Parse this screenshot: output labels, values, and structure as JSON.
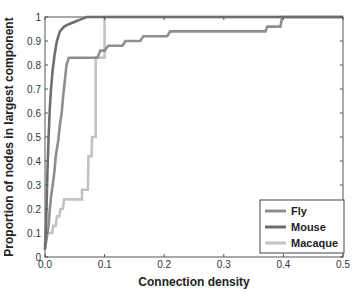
{
  "chart_data": {
    "type": "line",
    "title": "",
    "xlabel": "Connection density",
    "ylabel": "Proportion of nodes in largest component",
    "xlim": [
      0,
      0.5
    ],
    "ylim": [
      0,
      1
    ],
    "grid": false,
    "legend_position": "lower right",
    "x_ticks": [
      "0.0",
      "0.1",
      "0.2",
      "0.3",
      "0.4",
      "0.5"
    ],
    "y_ticks": [
      "0",
      "0.1",
      "0.2",
      "0.3",
      "0.4",
      "0.5",
      "0.6",
      "0.7",
      "0.8",
      "0.9",
      "1"
    ],
    "series": [
      {
        "name": "Fly",
        "color": "#8e8e8e",
        "points": [
          [
            0.0,
            0.04
          ],
          [
            0.003,
            0.08
          ],
          [
            0.006,
            0.13
          ],
          [
            0.008,
            0.2
          ],
          [
            0.01,
            0.25
          ],
          [
            0.013,
            0.3
          ],
          [
            0.016,
            0.36
          ],
          [
            0.018,
            0.42
          ],
          [
            0.022,
            0.48
          ],
          [
            0.025,
            0.55
          ],
          [
            0.028,
            0.6
          ],
          [
            0.03,
            0.66
          ],
          [
            0.033,
            0.73
          ],
          [
            0.036,
            0.8
          ],
          [
            0.04,
            0.83
          ],
          [
            0.088,
            0.83
          ],
          [
            0.093,
            0.86
          ],
          [
            0.1,
            0.86
          ],
          [
            0.106,
            0.88
          ],
          [
            0.13,
            0.88
          ],
          [
            0.135,
            0.9
          ],
          [
            0.16,
            0.9
          ],
          [
            0.165,
            0.92
          ],
          [
            0.205,
            0.92
          ],
          [
            0.21,
            0.94
          ],
          [
            0.37,
            0.94
          ],
          [
            0.373,
            0.96
          ],
          [
            0.395,
            0.96
          ],
          [
            0.398,
            1.0
          ],
          [
            0.5,
            1.0
          ]
        ]
      },
      {
        "name": "Mouse",
        "color": "#6e6e6e",
        "points": [
          [
            0.0,
            0.03
          ],
          [
            0.002,
            0.15
          ],
          [
            0.004,
            0.35
          ],
          [
            0.006,
            0.5
          ],
          [
            0.008,
            0.62
          ],
          [
            0.01,
            0.7
          ],
          [
            0.013,
            0.78
          ],
          [
            0.016,
            0.84
          ],
          [
            0.02,
            0.9
          ],
          [
            0.025,
            0.94
          ],
          [
            0.032,
            0.96
          ],
          [
            0.04,
            0.97
          ],
          [
            0.05,
            0.98
          ],
          [
            0.06,
            0.99
          ],
          [
            0.07,
            1.0
          ],
          [
            0.5,
            1.0
          ]
        ]
      },
      {
        "name": "Macaque",
        "color": "#c2c2c2",
        "points": [
          [
            0.0,
            0.05
          ],
          [
            0.003,
            0.1
          ],
          [
            0.012,
            0.1
          ],
          [
            0.014,
            0.13
          ],
          [
            0.018,
            0.13
          ],
          [
            0.02,
            0.17
          ],
          [
            0.024,
            0.17
          ],
          [
            0.026,
            0.2
          ],
          [
            0.03,
            0.2
          ],
          [
            0.032,
            0.24
          ],
          [
            0.062,
            0.24
          ],
          [
            0.062,
            0.28
          ],
          [
            0.072,
            0.28
          ],
          [
            0.073,
            0.42
          ],
          [
            0.078,
            0.42
          ],
          [
            0.079,
            0.5
          ],
          [
            0.085,
            0.5
          ],
          [
            0.085,
            0.83
          ],
          [
            0.1,
            0.83
          ],
          [
            0.1,
            1.0
          ],
          [
            0.5,
            1.0
          ]
        ]
      }
    ]
  }
}
